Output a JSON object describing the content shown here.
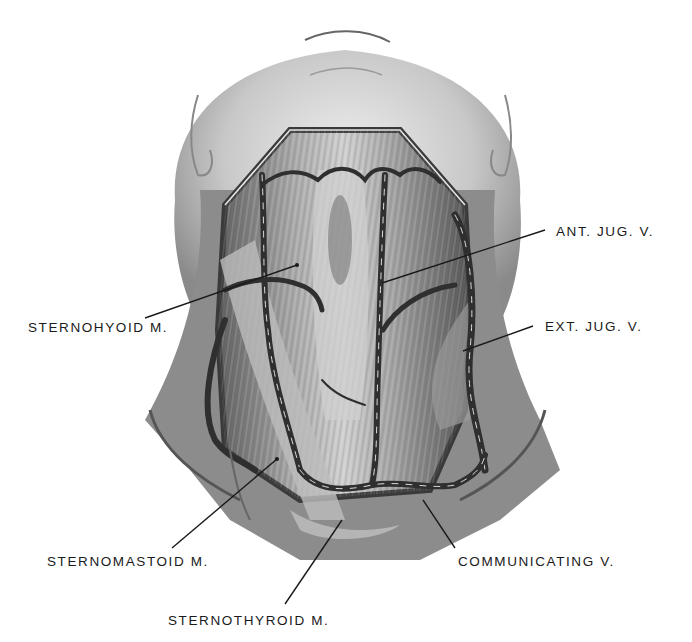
{
  "figure": {
    "style": "grayscale anatomical pencil drawing",
    "colors": {
      "background": "#ffffff",
      "ink": "#1a1a1a",
      "skin_light": "#d9d9d9",
      "skin_dark": "#6e6e6e",
      "vein": "#3a3a3a"
    }
  },
  "labels": [
    {
      "id": "sternohyoid",
      "text": "STERNOHYOID M.",
      "x": 28,
      "y": 321,
      "line": [
        145,
        318,
        297,
        265
      ]
    },
    {
      "id": "ant-jug",
      "text": "ANT. JUG. V.",
      "x": 556,
      "y": 225,
      "line": [
        545,
        230,
        382,
        283
      ]
    },
    {
      "id": "ext-jug",
      "text": "EXT. JUG. V.",
      "x": 545,
      "y": 320,
      "line": [
        533,
        326,
        463,
        351
      ]
    },
    {
      "id": "sternomastoid",
      "text": "STERNOMASTOID M.",
      "x": 47,
      "y": 555,
      "line": [
        172,
        548,
        277,
        459
      ]
    },
    {
      "id": "sternothyroid",
      "text": "STERNOTHYROID M.",
      "x": 168,
      "y": 614,
      "line": [
        285,
        604,
        342,
        520
      ]
    },
    {
      "id": "communicating",
      "text": "COMMUNICATING V.",
      "x": 458,
      "y": 555,
      "line": [
        455,
        548,
        423,
        500
      ]
    }
  ]
}
